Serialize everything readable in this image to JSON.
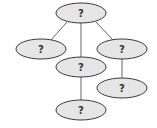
{
  "diagram": {
    "type": "tree",
    "colors": {
      "node_fill": "#e6e6e6",
      "node_stroke": "#3a3a3a",
      "edge": "#555555",
      "label": "#333333"
    },
    "nodes": [
      {
        "id": "root",
        "label": "?",
        "cx": 81,
        "cy": 13
      },
      {
        "id": "left",
        "label": "?",
        "cx": 41,
        "cy": 49
      },
      {
        "id": "middle",
        "label": "?",
        "cx": 81,
        "cy": 67
      },
      {
        "id": "right",
        "label": "?",
        "cx": 122,
        "cy": 49
      },
      {
        "id": "middle-child",
        "label": "?",
        "cx": 81,
        "cy": 110
      },
      {
        "id": "right-child",
        "label": "?",
        "cx": 122,
        "cy": 88
      }
    ],
    "edges": [
      {
        "from": "root",
        "to": "left"
      },
      {
        "from": "root",
        "to": "middle"
      },
      {
        "from": "root",
        "to": "right"
      },
      {
        "from": "middle",
        "to": "middle-child"
      },
      {
        "from": "right",
        "to": "right-child"
      }
    ]
  }
}
